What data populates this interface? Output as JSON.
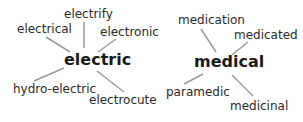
{
  "diagrams": [
    {
      "center": "electric",
      "words": [
        "electrify",
        "electrical",
        "electronic",
        "hydro-electric",
        "electrocute"
      ]
    },
    {
      "center": "medical",
      "words": [
        "medication",
        "medicated",
        "paramedic",
        "medicinal"
      ]
    }
  ],
  "colors": {
    "text": "#2a2a2a",
    "lines": "#9a9a9a",
    "background": "#ffffff"
  }
}
